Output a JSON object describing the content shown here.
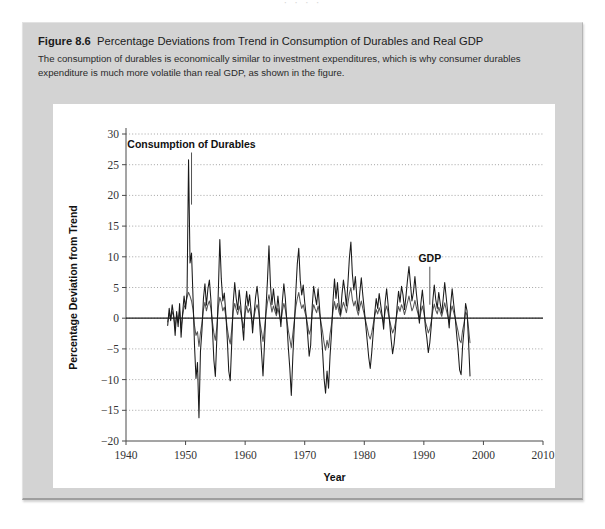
{
  "page": {
    "bleed_text": "·  ·      ·   ·"
  },
  "figure": {
    "number_label": "Figure 8.6",
    "title": "Percentage Deviations from Trend in Consumption of Durables and Real GDP",
    "caption": "The consumption of durables is economically similar to investment expenditures, which is why consumer durables expenditure is much more volatile than real GDP, as shown in the figure."
  },
  "chart_data": {
    "type": "line",
    "title": "Percentage Deviations from Trend in Consumption of Durables and Real GDP",
    "xlabel": "Year",
    "ylabel": "Percentage Deviation from Trend",
    "xlim": [
      1940,
      2010
    ],
    "ylim": [
      -20,
      30
    ],
    "xticks": [
      1940,
      1950,
      1960,
      1970,
      1980,
      1990,
      2000,
      2010
    ],
    "yticks": [
      -20,
      -15,
      -10,
      -5,
      0,
      5,
      10,
      15,
      20,
      25,
      30
    ],
    "grid": "horizontal-dotted",
    "zero_line": true,
    "legend": "annotations",
    "colors": {
      "durables": "#1a1a1a",
      "gdp": "#555555",
      "grid": "#9a9a9a",
      "axis": "#4a4a4a",
      "panel_bg": "#d3d3d3",
      "card_bg": "#ffffff"
    },
    "annotations": [
      {
        "text": "Consumption of Durables",
        "x": 1951.0,
        "y": 27.8,
        "leader_to_y": 18.5
      },
      {
        "text": "GDP",
        "x": 1991.0,
        "y": 9.2,
        "leader_to_y": 2.2
      }
    ],
    "x_start": 1947.0,
    "x_step": 0.25,
    "series": [
      {
        "name": "Consumption of Durables",
        "values": [
          -1.2,
          1.6,
          -0.4,
          2.2,
          0.5,
          -2.8,
          1.1,
          -1.4,
          2.4,
          -3.1,
          0.8,
          3.6,
          1.5,
          4.2,
          25.8,
          9.0,
          10.6,
          3.4,
          -4.5,
          -9.8,
          -7.2,
          -16.2,
          -5.4,
          -2.0,
          3.2,
          5.6,
          2.1,
          4.8,
          6.2,
          3.0,
          -1.5,
          -6.8,
          -9.5,
          -3.2,
          4.5,
          12.8,
          6.4,
          2.8,
          4.1,
          0.9,
          -3.4,
          -8.6,
          -10.2,
          -4.0,
          2.6,
          5.8,
          3.2,
          1.4,
          4.6,
          2.2,
          -0.8,
          -3.6,
          1.8,
          4.4,
          2.0,
          3.8,
          1.2,
          -2.4,
          0.6,
          3.4,
          5.2,
          2.8,
          -1.8,
          -5.6,
          -9.4,
          -4.2,
          1.6,
          6.2,
          11.8,
          5.4,
          2.2,
          4.8,
          2.4,
          0.8,
          3.6,
          1.2,
          -1.4,
          2.8,
          5.6,
          3.2,
          -0.6,
          -4.8,
          -8.2,
          -12.6,
          -6.4,
          -1.2,
          4.2,
          8.8,
          11.4,
          6.2,
          3.8,
          5.4,
          2.6,
          0.4,
          -2.8,
          -6.2,
          -4.4,
          1.8,
          5.2,
          3.6,
          2.2,
          4.8,
          1.6,
          -1.8,
          -5.4,
          -9.8,
          -12.2,
          -8.6,
          -11.4,
          -6.2,
          -2.4,
          2.8,
          6.4,
          3.2,
          5.8,
          2.4,
          0.6,
          3.8,
          6.2,
          4.4,
          2.0,
          5.6,
          9.8,
          12.4,
          7.2,
          4.6,
          6.8,
          3.4,
          1.2,
          4.2,
          6.6,
          3.8,
          1.4,
          -1.2,
          -3.8,
          -6.4,
          -8.2,
          -5.6,
          -2.4,
          0.8,
          3.2,
          1.6,
          4.0,
          2.2,
          0.4,
          -1.8,
          2.6,
          4.8,
          2.2,
          -0.6,
          -3.4,
          -5.8,
          -4.2,
          -1.6,
          1.8,
          4.4,
          2.6,
          5.2,
          3.8,
          1.4,
          3.6,
          6.2,
          8.4,
          5.6,
          2.8,
          4.2,
          6.8,
          4.0,
          1.8,
          -0.8,
          2.4,
          4.6,
          2.0,
          -1.4,
          -3.2,
          -5.6,
          -4.0,
          -1.2,
          2.8,
          5.4,
          3.0,
          1.6,
          4.2,
          2.4,
          0.8,
          3.2,
          5.8,
          3.4,
          1.0,
          -1.6,
          2.2,
          4.8,
          2.4,
          0.2,
          -2.6,
          -5.2,
          -8.4,
          -9.2,
          -4.6,
          -1.8,
          2.4,
          1.2,
          -3.8,
          -9.4
        ]
      },
      {
        "name": "GDP",
        "values": [
          -0.6,
          0.8,
          -0.2,
          1.1,
          0.3,
          -1.4,
          0.5,
          -0.7,
          1.2,
          -1.6,
          0.4,
          1.8,
          2.2,
          3.4,
          4.2,
          3.6,
          2.8,
          1.4,
          -1.2,
          -2.8,
          -2.2,
          -4.6,
          -2.4,
          -0.8,
          1.4,
          2.6,
          1.2,
          2.2,
          2.8,
          1.6,
          -0.6,
          -2.4,
          -3.6,
          -1.4,
          1.8,
          3.4,
          2.6,
          1.2,
          1.8,
          0.4,
          -1.6,
          -3.2,
          -4.2,
          -1.8,
          1.2,
          2.4,
          1.4,
          0.6,
          2.0,
          1.0,
          -0.4,
          -1.6,
          0.8,
          2.0,
          0.9,
          1.6,
          0.5,
          -1.1,
          0.3,
          1.5,
          2.2,
          1.2,
          -0.8,
          -2.2,
          -3.8,
          -1.8,
          0.7,
          2.6,
          3.8,
          2.4,
          1.0,
          2.0,
          1.1,
          0.4,
          1.6,
          0.5,
          -0.6,
          1.2,
          2.4,
          1.4,
          -0.3,
          -2.0,
          -3.4,
          -4.8,
          -2.6,
          -0.5,
          1.8,
          3.2,
          4.2,
          2.6,
          1.6,
          2.2,
          1.1,
          0.2,
          -1.2,
          -2.6,
          -1.8,
          0.8,
          2.2,
          1.5,
          0.9,
          2.0,
          0.7,
          -0.8,
          -2.2,
          -4.0,
          -5.2,
          -3.6,
          -4.8,
          -2.6,
          -1.0,
          1.2,
          2.7,
          1.4,
          2.4,
          1.0,
          0.3,
          1.6,
          2.6,
          1.8,
          0.9,
          2.4,
          4.0,
          5.0,
          3.0,
          2.0,
          2.8,
          1.4,
          0.5,
          1.8,
          2.8,
          1.6,
          0.6,
          -0.5,
          -1.6,
          -2.8,
          -3.4,
          -2.4,
          -1.0,
          0.4,
          1.4,
          0.7,
          1.7,
          0.9,
          0.2,
          -0.8,
          1.1,
          2.0,
          0.9,
          -0.3,
          -1.4,
          -2.4,
          -1.8,
          -0.7,
          0.8,
          1.9,
          1.1,
          2.2,
          1.6,
          0.6,
          1.5,
          2.6,
          3.6,
          2.4,
          1.2,
          1.8,
          2.9,
          1.7,
          0.8,
          -0.3,
          1.0,
          2.0,
          0.9,
          -0.6,
          -1.4,
          -2.4,
          -1.7,
          -0.5,
          1.2,
          2.3,
          1.3,
          0.7,
          1.8,
          1.0,
          0.3,
          1.4,
          2.5,
          1.4,
          0.4,
          -0.7,
          0.9,
          2.0,
          1.0,
          0.1,
          -1.1,
          -2.2,
          -3.6,
          -4.0,
          -2.0,
          -0.8,
          1.0,
          0.5,
          -1.6,
          -4.0
        ]
      }
    ]
  }
}
